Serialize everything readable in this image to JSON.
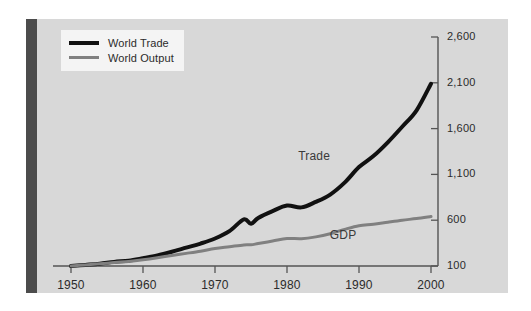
{
  "figure": {
    "background_color": "#d8d8d8",
    "accent_bar_color": "#4c4c4c",
    "page_background": "#ffffff"
  },
  "legend": {
    "items": [
      {
        "label": "World Trade",
        "color": "#111111"
      },
      {
        "label": "World Output",
        "color": "#808080"
      }
    ]
  },
  "annotations": [
    {
      "text": "Trade",
      "series": "World Trade"
    },
    {
      "text": "GDP",
      "series": "World Output"
    }
  ],
  "chart_data": {
    "type": "line",
    "title": "",
    "subtitle": "",
    "xlabel": "",
    "ylabel": "",
    "xlim": [
      1950,
      2000
    ],
    "ylim": [
      100,
      2600
    ],
    "grid": false,
    "legend_position": "top-left",
    "yaxis_position": "right",
    "xticks": [
      1950,
      1960,
      1970,
      1980,
      1990,
      2000
    ],
    "xtick_labels": [
      "1950",
      "1960",
      "1970",
      "1980",
      "1990",
      "2000"
    ],
    "yticks": [
      100,
      600,
      1100,
      1600,
      2100,
      2600
    ],
    "ytick_labels": [
      "100",
      "600",
      "1,100",
      "1,600",
      "2,100",
      "2,600"
    ],
    "x": [
      1950,
      1952,
      1954,
      1956,
      1958,
      1960,
      1962,
      1964,
      1966,
      1968,
      1970,
      1972,
      1974,
      1975,
      1976,
      1978,
      1980,
      1982,
      1984,
      1986,
      1988,
      1990,
      1992,
      1994,
      1996,
      1998,
      2000
    ],
    "series": [
      {
        "name": "World Trade",
        "annotation": "Trade",
        "color": "#111111",
        "line_width": 4,
        "values": [
          100,
          112,
          125,
          145,
          158,
          185,
          215,
          255,
          300,
          345,
          400,
          480,
          610,
          560,
          625,
          700,
          760,
          740,
          800,
          880,
          1010,
          1180,
          1300,
          1450,
          1620,
          1800,
          2090
        ]
      },
      {
        "name": "World Output",
        "annotation": "GDP",
        "color": "#808080",
        "line_width": 3,
        "values": [
          100,
          112,
          124,
          138,
          150,
          168,
          190,
          215,
          238,
          262,
          290,
          310,
          330,
          332,
          345,
          372,
          400,
          398,
          418,
          452,
          500,
          540,
          555,
          578,
          600,
          618,
          640
        ]
      }
    ]
  }
}
